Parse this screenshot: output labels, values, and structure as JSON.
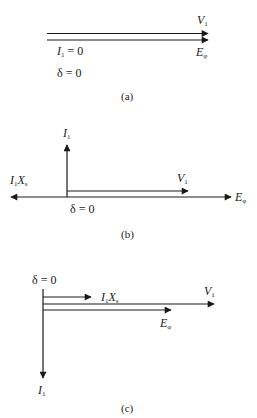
{
  "figure": {
    "type": "phasor-diagrams",
    "stroke_color": "#1a1a1a",
    "panels": [
      {
        "id": "a",
        "caption": "(a)",
        "labels": {
          "v1": {
            "main": "V",
            "sub": "1"
          },
          "ephi": {
            "main": "E",
            "sub": "φ"
          },
          "i1_zero": {
            "main": "I",
            "sub": "1",
            "rest": " = 0"
          },
          "delta_zero": "δ = 0"
        }
      },
      {
        "id": "b",
        "caption": "(b)",
        "labels": {
          "i1": {
            "main": "I",
            "sub": "1"
          },
          "v1": {
            "main": "V",
            "sub": "1"
          },
          "i1xs": {
            "main1": "I",
            "sub1": "1",
            "main2": "X",
            "sub2": "s"
          },
          "ephi": {
            "main": "E",
            "sub": "φ"
          },
          "delta_zero": "δ = 0"
        }
      },
      {
        "id": "c",
        "caption": "(c)",
        "labels": {
          "delta_zero": "δ = 0",
          "i1xs": {
            "main1": "I",
            "sub1": "1",
            "main2": "X",
            "sub2": "s"
          },
          "v1": {
            "main": "V",
            "sub": "1"
          },
          "ephi": {
            "main": "E",
            "sub": "φ"
          },
          "i1": {
            "main": "I",
            "sub": "1"
          }
        }
      }
    ]
  }
}
